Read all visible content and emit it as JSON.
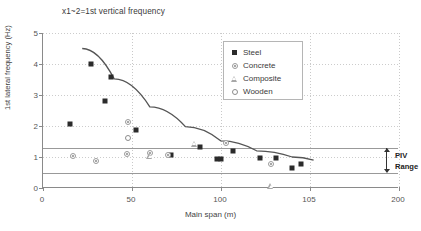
{
  "chart_data": {
    "type": "scatter",
    "title": "x1~2=1st vertical frequency",
    "xlabel": "Main span (m)",
    "ylabel": "1st lateral frequency (Hz)",
    "xlim": [
      0,
      200
    ],
    "ylim": [
      0,
      5
    ],
    "xticks": [
      0,
      50,
      100,
      105,
      200
    ],
    "xtick_labels": [
      "0",
      "50",
      "100",
      "105",
      "200"
    ],
    "yticks": [
      0,
      1,
      2,
      3,
      4,
      5
    ],
    "ytick_labels": [
      "0",
      "1",
      "2",
      "3",
      "4",
      "5"
    ],
    "grid": true,
    "legend_position": "upper right",
    "series": [
      {
        "name": "Steel",
        "marker": "filled-square",
        "color": "#2b2b2b",
        "points": [
          {
            "x": 15,
            "y": 2.07
          },
          {
            "x": 27,
            "y": 4.0
          },
          {
            "x": 35,
            "y": 2.82
          },
          {
            "x": 38,
            "y": 3.58
          },
          {
            "x": 52,
            "y": 1.88
          },
          {
            "x": 72,
            "y": 1.05
          },
          {
            "x": 88,
            "y": 1.32
          },
          {
            "x": 98,
            "y": 0.92
          },
          {
            "x": 100,
            "y": 0.93
          },
          {
            "x": 107,
            "y": 1.18
          },
          {
            "x": 122,
            "y": 0.97
          },
          {
            "x": 131,
            "y": 0.98
          },
          {
            "x": 140,
            "y": 0.63
          },
          {
            "x": 145,
            "y": 0.78
          }
        ]
      },
      {
        "name": "Concrete",
        "marker": "dotted-circle",
        "color": "#9a9a9a",
        "points": [
          {
            "x": 17,
            "y": 1.02
          },
          {
            "x": 30,
            "y": 0.88
          },
          {
            "x": 47,
            "y": 1.1
          },
          {
            "x": 48,
            "y": 2.12
          },
          {
            "x": 60,
            "y": 1.12
          },
          {
            "x": 70,
            "y": 1.05
          },
          {
            "x": 103,
            "y": 1.45
          },
          {
            "x": 128,
            "y": 0.78
          }
        ]
      },
      {
        "name": "Composite",
        "marker": "open-triangle",
        "color": "#a8a8a8",
        "points": [
          {
            "x": 60,
            "y": 1.02
          },
          {
            "x": 85,
            "y": 1.62
          },
          {
            "x": 128,
            "y": 0.44
          }
        ]
      },
      {
        "name": "Wooden",
        "marker": "open-circle",
        "color": "#8c8c8c",
        "points": [
          {
            "x": 48,
            "y": 1.62
          }
        ]
      }
    ],
    "trend_curve": {
      "description": "fitted decay curve through steel data",
      "points": [
        {
          "x": 22,
          "y": 4.5
        },
        {
          "x": 40,
          "y": 3.52
        },
        {
          "x": 60,
          "y": 2.62
        },
        {
          "x": 80,
          "y": 1.98
        },
        {
          "x": 100,
          "y": 1.52
        },
        {
          "x": 120,
          "y": 1.2
        },
        {
          "x": 140,
          "y": 1.0
        },
        {
          "x": 152,
          "y": 0.9
        }
      ]
    },
    "reference_lines": [
      {
        "y": 1.3,
        "label": "PIV upper bound"
      },
      {
        "y": 0.5,
        "label": "PIV lower bound"
      }
    ],
    "annotations": [
      {
        "text": "PIV",
        "x": 160,
        "y": 1.05
      },
      {
        "text": "Range",
        "x": 160,
        "y": 0.75
      }
    ]
  },
  "legend": {
    "items": [
      {
        "label": "Steel",
        "marker": "filled-square"
      },
      {
        "label": "Concrete",
        "marker": "dotted-circle"
      },
      {
        "label": "Composite",
        "marker": "open-triangle"
      },
      {
        "label": "Wooden",
        "marker": "open-circle"
      }
    ]
  },
  "piv": {
    "line1": "PIV",
    "line2": "Range"
  }
}
